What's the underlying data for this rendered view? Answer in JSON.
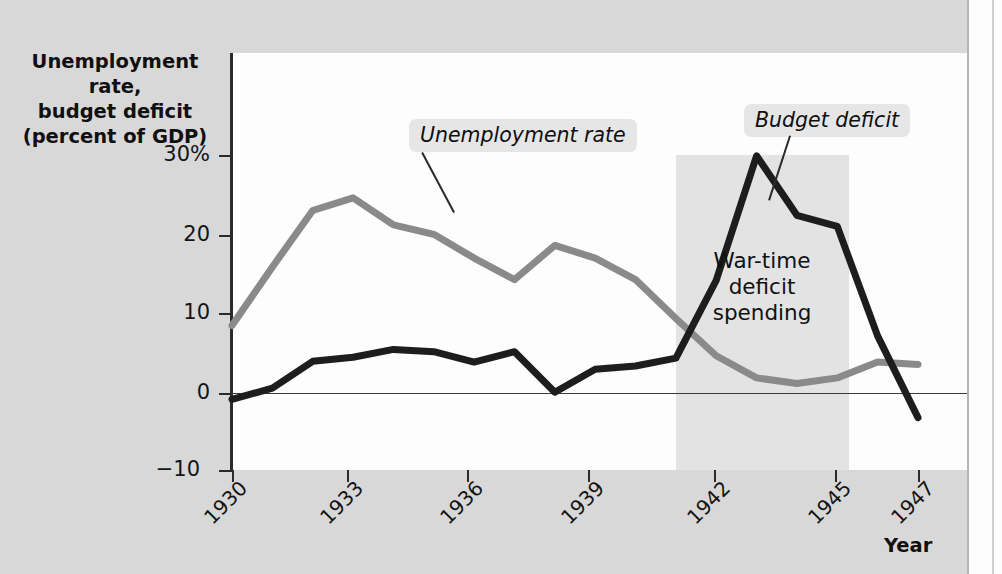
{
  "chart_data": {
    "type": "line",
    "title": "",
    "ylabel": "Unemployment rate, budget deficit (percent of GDP)",
    "xlabel": "Year",
    "ylim": [
      -10,
      33
    ],
    "xlim": [
      1930,
      1947
    ],
    "yticks": [
      "30%",
      "20",
      "10",
      "0",
      "−10"
    ],
    "ytick_values": [
      30,
      20,
      10,
      0,
      -10
    ],
    "xticks": [
      "1930",
      "1933",
      "1936",
      "1939",
      "1942",
      "1945",
      "1947"
    ],
    "xtick_values": [
      1930,
      1933,
      1936,
      1939,
      1942,
      1945,
      1947
    ],
    "grid": false,
    "legend_position": "inline-callouts",
    "x": [
      1930,
      1931,
      1932,
      1933,
      1934,
      1935,
      1936,
      1937,
      1938,
      1939,
      1940,
      1941,
      1942,
      1943,
      1944,
      1945,
      1946,
      1947
    ],
    "series": [
      {
        "name": "Unemployment rate",
        "color": "#8a8a8a",
        "values": [
          8.5,
          15.9,
          23.0,
          24.6,
          21.2,
          20.0,
          17.0,
          14.3,
          18.6,
          17.0,
          14.3,
          9.4,
          4.7,
          1.9,
          1.2,
          1.9,
          3.9,
          3.6
        ]
      },
      {
        "name": "Budget deficit",
        "color": "#1d1d1d",
        "values": [
          -0.8,
          0.6,
          4.0,
          4.5,
          5.5,
          5.2,
          3.9,
          5.2,
          0.1,
          3.0,
          3.4,
          4.4,
          14.2,
          29.9,
          22.4,
          21.0,
          7.2,
          -3.1
        ]
      }
    ],
    "annotations": [
      {
        "name": "war-time-shading",
        "label": "War-time deficit spending",
        "x_start": 1941,
        "x_end": 1945.3
      }
    ]
  },
  "axis": {
    "title_line1": "Unemployment rate,",
    "title_line2": "budget deficit",
    "title_line3": "(percent of GDP)",
    "x_axis_title": "Year"
  },
  "callouts": {
    "unemployment": "Unemployment rate",
    "budget": "Budget deficit"
  },
  "annotation": {
    "line1": "War-time",
    "line2": "deficit",
    "line3": "spending"
  },
  "colors": {
    "unemployment_line": "#8a8a8a",
    "budget_line": "#1d1d1d",
    "page_background": "#d8d8d8",
    "plot_background": "#fdfdfd",
    "shade_band": "#e3e3e3"
  }
}
